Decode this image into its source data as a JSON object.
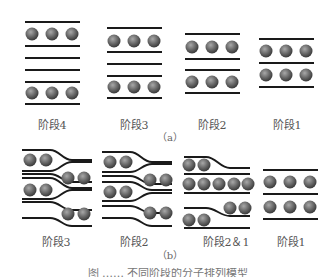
{
  "figure": {
    "panel_a": {
      "label": "（a）",
      "stages": [
        {
          "id": "stage4",
          "label": "阶段4"
        },
        {
          "id": "stage3",
          "label": "阶段3"
        },
        {
          "id": "stage2",
          "label": "阶段2"
        },
        {
          "id": "stage1",
          "label": "阶段1"
        }
      ]
    },
    "panel_b": {
      "label": "（b）",
      "stages": [
        {
          "id": "stage3",
          "label": "阶段3"
        },
        {
          "id": "stage2",
          "label": "阶段2"
        },
        {
          "id": "stage2and1",
          "label": "阶段2＆1"
        },
        {
          "id": "stage1",
          "label": "阶段1"
        }
      ]
    },
    "caption": "图 ……  不同阶段的分子排列模型",
    "colors": {
      "line": "#1a1a1a",
      "ball_light": "#9a9a9a",
      "ball_dark": "#3a3a3a"
    }
  }
}
